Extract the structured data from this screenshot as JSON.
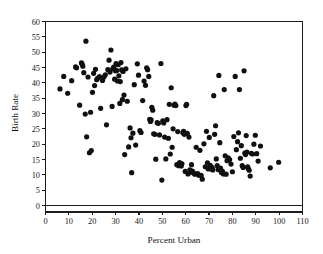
{
  "chart_data": {
    "type": "scatter",
    "title": "",
    "xlabel": "Percent Urban",
    "ylabel": "Birth Rate",
    "xlim": [
      0,
      110
    ],
    "ylim": [
      0,
      60
    ],
    "xticks": [
      0,
      10,
      20,
      30,
      40,
      50,
      60,
      70,
      80,
      90,
      100,
      110
    ],
    "yticks": [
      0,
      5,
      10,
      15,
      20,
      25,
      30,
      35,
      40,
      45,
      50,
      55,
      60
    ],
    "grid": false,
    "legend": null,
    "marker": {
      "shape": "circle",
      "color": "#101010",
      "size": 2.6
    },
    "series": [
      {
        "name": "Countries",
        "points": [
          [
            6.2,
            38.0
          ],
          [
            7.8,
            42.1
          ],
          [
            9.5,
            36.6
          ],
          [
            11.2,
            40.7
          ],
          [
            12.9,
            45.2
          ],
          [
            13.3,
            44.9
          ],
          [
            14.6,
            32.7
          ],
          [
            15.4,
            46.5
          ],
          [
            15.7,
            46.1
          ],
          [
            16.0,
            45.4
          ],
          [
            16.4,
            43.3
          ],
          [
            17.0,
            29.8
          ],
          [
            17.3,
            53.6
          ],
          [
            17.6,
            22.4
          ],
          [
            18.2,
            41.9
          ],
          [
            18.8,
            17.2
          ],
          [
            19.3,
            30.4
          ],
          [
            19.6,
            17.9
          ],
          [
            20.1,
            36.9
          ],
          [
            20.6,
            43.1
          ],
          [
            21.0,
            39.1
          ],
          [
            21.4,
            44.4
          ],
          [
            21.9,
            41.0
          ],
          [
            22.3,
            41.5
          ],
          [
            23.1,
            42.0
          ],
          [
            23.6,
            31.7
          ],
          [
            24.4,
            40.8
          ],
          [
            25.0,
            41.9
          ],
          [
            25.6,
            42.6
          ],
          [
            26.1,
            26.3
          ],
          [
            26.7,
            44.3
          ],
          [
            27.2,
            47.4
          ],
          [
            27.6,
            43.5
          ],
          [
            28.0,
            50.7
          ],
          [
            28.5,
            32.3
          ],
          [
            28.8,
            44.6
          ],
          [
            29.2,
            45.1
          ],
          [
            29.6,
            41.2
          ],
          [
            29.9,
            43.9
          ],
          [
            30.2,
            46.3
          ],
          [
            30.5,
            44.0
          ],
          [
            30.8,
            40.6
          ],
          [
            31.1,
            45.9
          ],
          [
            31.4,
            42.3
          ],
          [
            31.8,
            33.3
          ],
          [
            32.0,
            40.4
          ],
          [
            32.3,
            46.6
          ],
          [
            32.6,
            44.2
          ],
          [
            32.9,
            34.5
          ],
          [
            33.2,
            43.7
          ],
          [
            33.6,
            36.0
          ],
          [
            33.9,
            16.6
          ],
          [
            34.4,
            44.6
          ],
          [
            35.0,
            34.0
          ],
          [
            35.6,
            19.1
          ],
          [
            36.2,
            25.3
          ],
          [
            36.6,
            22.1
          ],
          [
            36.9,
            10.7
          ],
          [
            37.4,
            23.6
          ],
          [
            38.0,
            39.4
          ],
          [
            38.6,
            19.7
          ],
          [
            39.3,
            46.2
          ],
          [
            39.8,
            42.5
          ],
          [
            40.4,
            24.4
          ],
          [
            40.9,
            23.8
          ],
          [
            41.6,
            34.2
          ],
          [
            42.2,
            40.6
          ],
          [
            42.8,
            39.2
          ],
          [
            43.3,
            44.9
          ],
          [
            43.7,
            44.3
          ],
          [
            44.2,
            42.1
          ],
          [
            44.6,
            28.1
          ],
          [
            44.9,
            27.4
          ],
          [
            45.2,
            27.9
          ],
          [
            45.5,
            32.0
          ],
          [
            45.9,
            31.1
          ],
          [
            46.3,
            23.4
          ],
          [
            46.8,
            23.2
          ],
          [
            47.2,
            15.1
          ],
          [
            47.8,
            27.0
          ],
          [
            48.3,
            26.8
          ],
          [
            48.8,
            23.0
          ],
          [
            49.4,
            46.3
          ],
          [
            49.8,
            8.3
          ],
          [
            50.2,
            27.6
          ],
          [
            50.6,
            26.9
          ],
          [
            51.0,
            22.3
          ],
          [
            51.5,
            15.2
          ],
          [
            52.0,
            28.0
          ],
          [
            52.6,
            21.9
          ],
          [
            53.0,
            33.0
          ],
          [
            53.4,
            16.8
          ],
          [
            53.8,
            38.4
          ],
          [
            54.2,
            19.0
          ],
          [
            54.6,
            25.0
          ],
          [
            55.0,
            32.7
          ],
          [
            55.4,
            33.1
          ],
          [
            55.8,
            32.6
          ],
          [
            56.2,
            13.3
          ],
          [
            56.6,
            24.1
          ],
          [
            57.0,
            13.0
          ],
          [
            57.4,
            14.0
          ],
          [
            57.8,
            13.4
          ],
          [
            58.1,
            12.9
          ],
          [
            58.4,
            13.6
          ],
          [
            58.8,
            23.7
          ],
          [
            59.1,
            24.2
          ],
          [
            59.4,
            23.2
          ],
          [
            59.8,
            11.1
          ],
          [
            60.1,
            32.6
          ],
          [
            60.4,
            33.0
          ],
          [
            60.7,
            23.5
          ],
          [
            61.0,
            10.3
          ],
          [
            61.4,
            22.3
          ],
          [
            61.8,
            11.6
          ],
          [
            62.1,
            10.9
          ],
          [
            62.5,
            13.3
          ],
          [
            62.9,
            11.2
          ],
          [
            63.4,
            10.6
          ],
          [
            63.9,
            10.2
          ],
          [
            64.5,
            19.0
          ],
          [
            65.1,
            10.4
          ],
          [
            65.6,
            9.9
          ],
          [
            66.1,
            18.0
          ],
          [
            66.6,
            9.8
          ],
          [
            67.1,
            8.6
          ],
          [
            67.8,
            20.1
          ],
          [
            68.4,
            12.6
          ],
          [
            68.9,
            24.2
          ],
          [
            69.3,
            13.9
          ],
          [
            69.7,
            11.9
          ],
          [
            70.1,
            22.2
          ],
          [
            70.5,
            13.1
          ],
          [
            70.9,
            12.0
          ],
          [
            71.3,
            12.4
          ],
          [
            71.6,
            11.6
          ],
          [
            72.0,
            35.8
          ],
          [
            72.4,
            23.2
          ],
          [
            72.8,
            26.0
          ],
          [
            73.1,
            15.2
          ],
          [
            73.5,
            13.0
          ],
          [
            73.9,
            11.7
          ],
          [
            74.2,
            42.4
          ],
          [
            74.6,
            20.5
          ],
          [
            74.9,
            12.2
          ],
          [
            75.3,
            10.8
          ],
          [
            75.7,
            11.2
          ],
          [
            76.1,
            10.3
          ],
          [
            76.5,
            37.8
          ],
          [
            76.9,
            16.2
          ],
          [
            77.3,
            10.2
          ],
          [
            77.7,
            14.6
          ],
          [
            78.2,
            15.5
          ],
          [
            78.8,
            15.0
          ],
          [
            79.4,
            13.5
          ],
          [
            80.0,
            11.0
          ],
          [
            80.6,
            22.5
          ],
          [
            81.2,
            42.1
          ],
          [
            81.7,
            18.2
          ],
          [
            82.2,
            20.8
          ],
          [
            82.6,
            23.7
          ],
          [
            83.0,
            37.8
          ],
          [
            83.4,
            15.4
          ],
          [
            83.8,
            19.5
          ],
          [
            84.2,
            13.0
          ],
          [
            84.6,
            12.4
          ],
          [
            85.0,
            43.9
          ],
          [
            85.3,
            17.1
          ],
          [
            85.6,
            16.6
          ],
          [
            85.9,
            22.8
          ],
          [
            86.2,
            17.4
          ],
          [
            86.5,
            12.6
          ],
          [
            86.8,
            12.0
          ],
          [
            87.2,
            11.5
          ],
          [
            87.6,
            9.6
          ],
          [
            88.1,
            17.0
          ],
          [
            88.6,
            16.8
          ],
          [
            89.2,
            20.0
          ],
          [
            89.8,
            22.9
          ],
          [
            90.4,
            16.9
          ],
          [
            91.0,
            14.5
          ],
          [
            92.0,
            19.4
          ],
          [
            96.2,
            12.3
          ],
          [
            99.8,
            14.1
          ]
        ]
      }
    ]
  },
  "axes": {
    "x_title": "Percent Urban",
    "y_title": "Birth Rate",
    "x_tick_labels": [
      "0",
      "10",
      "20",
      "30",
      "40",
      "50",
      "60",
      "70",
      "80",
      "90",
      "100",
      "110"
    ],
    "y_tick_labels": [
      "0",
      "5",
      "10",
      "15",
      "20",
      "25",
      "30",
      "35",
      "40",
      "45",
      "50",
      "55",
      "60"
    ]
  },
  "colors": {
    "marker": "#101010",
    "axis": "#1c1c1c",
    "background": "#ffffff",
    "text": "#171717"
  }
}
